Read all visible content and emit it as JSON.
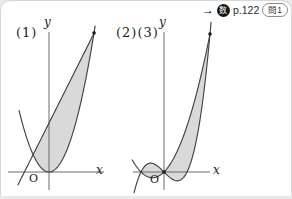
{
  "header": {
    "arrow": "→",
    "badge_char": "数",
    "page_ref": "p.122",
    "problem_ref": "問1"
  },
  "style": {
    "region_fill": "#d9d9d9",
    "curve_color": "#424242",
    "axis_color": "#5c5c5c",
    "point_color": "#1d1d1d"
  },
  "chart_data": [
    {
      "id": "figure-1",
      "type": "line",
      "title": "(1)",
      "description": "Shaded region enclosed between a parabola and a line",
      "axis_labels": {
        "x": "x",
        "y": "y",
        "origin": "O"
      },
      "grid": false,
      "ticks": false,
      "curves": [
        {
          "name": "parabola y = x^2",
          "poly": [
            0,
            0,
            1
          ],
          "domain": [
            -1.33,
            2.05
          ]
        },
        {
          "name": "line y = 1.29x + 1.41",
          "poly": [
            1.41,
            1.29
          ],
          "domain": [
            -1.38,
            2.03
          ]
        }
      ],
      "intersections_x": [
        -0.706,
        2
      ],
      "shaded_regions": [
        {
          "between": [
            1,
            0
          ],
          "from": -0.706,
          "to": 2
        }
      ],
      "points": [
        {
          "x": 2,
          "y": 4
        }
      ],
      "axes": {
        "origin_px": [
          49,
          172
        ],
        "scale_px": [
          22.5,
          34.75
        ],
        "x_axis_px": [
          8,
          104
        ],
        "y_axis_px": [
          32,
          190
        ]
      }
    },
    {
      "id": "figure-2-3",
      "type": "line",
      "title": "(2)(3)",
      "description": "Shaded regions enclosed between a cubic curve and a parabola",
      "axis_labels": {
        "x": "x",
        "y": "y",
        "origin": "O"
      },
      "grid": false,
      "ticks": false,
      "curves": [
        {
          "name": "cubic y = x^3 - x",
          "poly": [
            0,
            -1,
            0,
            1
          ],
          "domain": [
            -1.3,
            2.045
          ]
        },
        {
          "name": "parabola y = x^2 + x",
          "poly": [
            0,
            1,
            1
          ],
          "domain": [
            -1.38,
            2.01
          ]
        }
      ],
      "intersections_x": [
        -1,
        0,
        2
      ],
      "shaded_regions": [
        {
          "between": [
            0,
            1
          ],
          "from": -1,
          "to": 0
        },
        {
          "between": [
            1,
            0
          ],
          "from": 0,
          "to": 2
        }
      ],
      "points": [
        {
          "x": 0,
          "y": 0
        },
        {
          "x": 2,
          "y": 6
        }
      ],
      "axes": {
        "origin_px": [
          164,
          172
        ],
        "scale_px": [
          23,
          23
        ],
        "x_axis_px": [
          133,
          210
        ],
        "y_axis_px": [
          32,
          190
        ]
      }
    }
  ]
}
